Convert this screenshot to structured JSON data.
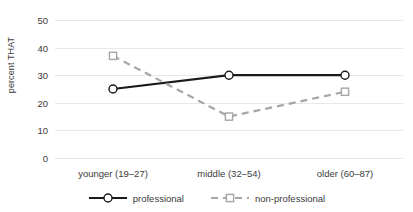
{
  "chart_data": {
    "type": "line",
    "title": "",
    "xlabel": "",
    "ylabel": "percent THAT",
    "categories": [
      "younger (19–27)",
      "middle (32–54)",
      "older (60–87)"
    ],
    "series": [
      {
        "name": "professional",
        "values": [
          25,
          30,
          30
        ],
        "color": "#1a1a1a",
        "line_style": "solid",
        "marker": "circle"
      },
      {
        "name": "non-professional",
        "values": [
          37,
          15,
          24
        ],
        "color": "#a6a6a6",
        "line_style": "dashed",
        "marker": "square"
      }
    ],
    "ylim": [
      0,
      50
    ],
    "ytick_labels": [
      "0",
      "10",
      "20",
      "30",
      "40",
      "50"
    ],
    "ytick_values": [
      0,
      10,
      20,
      30,
      40,
      50
    ],
    "grid": true,
    "grid_color": "#e8e8e8",
    "legend_position": "bottom"
  },
  "axis": {
    "y_title": "percent THAT"
  },
  "legend": {
    "items": [
      {
        "label": "professional"
      },
      {
        "label": "non-professional"
      }
    ]
  }
}
